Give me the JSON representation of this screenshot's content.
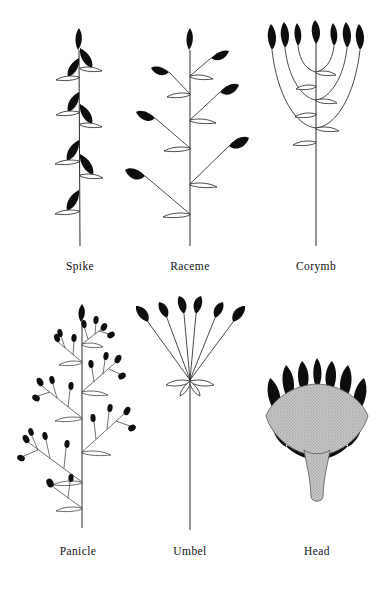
{
  "figure": {
    "background_color": "#ffffff",
    "ink_color": "#0d0d0d",
    "width": 380,
    "height": 597,
    "rows": 2,
    "columns": 3
  },
  "diagrams": [
    {
      "id": "spike",
      "label": "Spike",
      "row": 1,
      "column": 1,
      "description": "Unbranched main axis bearing sessile flowers attached directly to the stem, each subtended by a curved bract.",
      "floret_count": 8,
      "pedicels": "absent (sessile)",
      "axis": "single vertical stem",
      "label_x": 80,
      "label_y": 269
    },
    {
      "id": "raceme",
      "label": "Raceme",
      "row": 1,
      "column": 2,
      "description": "Unbranched main axis bearing stalked flowers on pedicels that lengthen toward the base, alternating left and right.",
      "floret_count": 6,
      "pedicels": "present, lengthening downward",
      "axis": "single vertical stem",
      "label_x": 190,
      "label_y": 269
    },
    {
      "id": "corymb",
      "label": "Corymb",
      "row": 1,
      "column": 3,
      "description": "Flowers borne on pedicels of unequal length arising at different levels so that all flowers reach the same height, forming a flat top.",
      "floret_count": 7,
      "pedicels": "curved, unequal lengths; flat-topped",
      "axis": "single vertical stem",
      "label_x": 316,
      "label_y": 269
    },
    {
      "id": "panicle",
      "label": "Panicle",
      "row": 2,
      "column": 1,
      "description": "A branched raceme: the main axis bears secondary branches, each of which carries several small stalked flowers.",
      "floret_count": 34,
      "branch_count": 7,
      "pedicels": "present on secondary branches",
      "axis": "branched vertical stem",
      "label_x": 80,
      "label_y": 548
    },
    {
      "id": "umbel",
      "label": "Umbel",
      "row": 2,
      "column": 2,
      "description": "Pedicels of nearly equal length all radiating from one point at the top of the peduncle, with an involucre of bracts at the junction.",
      "floret_count": 6,
      "pedicels": "equal length, radiating from one point",
      "axis": "long unbranched peduncle",
      "label_x": 190,
      "label_y": 548
    },
    {
      "id": "head",
      "label": "Head",
      "row": 2,
      "column": 3,
      "description": "Sessile flowers crowded onto a swollen common receptacle, surrounded beneath by an involucre of bracts.",
      "floret_count": 7,
      "pedicels": "absent (sessile on receptacle)",
      "axis": "short thick stalk with expanded receptacle",
      "receptacle_fill": "#b3b3b3",
      "label_x": 316,
      "label_y": 548
    }
  ]
}
